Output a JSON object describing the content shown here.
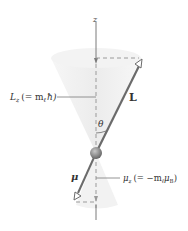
{
  "diagram": {
    "labels": {
      "z_axis": "z",
      "L_vector": "L",
      "theta": "θ",
      "mu_vector": "μ",
      "Lz_main": "L",
      "Lz_sub": "z",
      "Lz_expr_open": "(= m",
      "Lz_expr_sub": "ℓ",
      "Lz_expr_close": "ħ)",
      "muz_main": "μ",
      "muz_sub": "z",
      "muz_expr_open": "(= −m",
      "muz_expr_sub": "ℓ",
      "muz_expr_mu": "μ",
      "muz_expr_B": "B",
      "muz_expr_close": ")"
    },
    "colors": {
      "vector": "#6b6b6b",
      "axis": "#7a7a7a",
      "dashed": "#9a9a9a",
      "cone": "#eeeeee",
      "sphere": "#8c8c8c",
      "text": "#333333"
    }
  }
}
